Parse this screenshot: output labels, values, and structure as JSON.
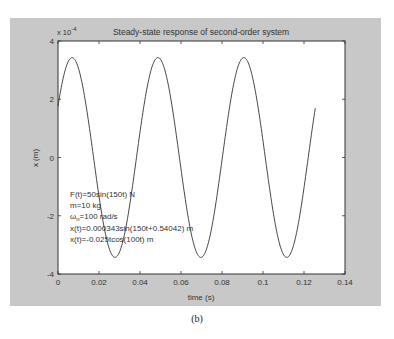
{
  "figure": {
    "background": "#c8c8c8",
    "caption": "(b)"
  },
  "chart_data": {
    "type": "line",
    "title": "Steady-state response of second-order system",
    "xlabel": "time (s)",
    "ylabel": "x (m)",
    "y_exponent_label": "x 10",
    "y_exponent": "-4",
    "xlim": [
      0,
      0.14
    ],
    "ylim": [
      -4,
      4
    ],
    "y_scale_factor": 0.0001,
    "xticks": [
      0,
      0.02,
      0.04,
      0.06,
      0.08,
      0.1,
      0.12,
      0.14
    ],
    "xtick_labels": [
      "0",
      "0.02",
      "0.04",
      "0.06",
      "0.08",
      "0.1",
      "0.12",
      "0.14"
    ],
    "yticks": [
      -4,
      -2,
      0,
      2,
      4
    ],
    "ytick_labels": [
      "-4",
      "-2",
      "0",
      "2",
      "4"
    ],
    "grid": false,
    "legend": null,
    "series": [
      {
        "name": "x(t)",
        "formula": "x(t)=0.000343sin(150t+0.54042)",
        "amplitude": 3.43,
        "omega": 150,
        "phase": 0.54042,
        "t_start": 0,
        "t_end": 0.1255,
        "color": "#333333",
        "sample_x": [
          0,
          0.005,
          0.01,
          0.015,
          0.02,
          0.025,
          0.03,
          0.035,
          0.04,
          0.045,
          0.05,
          0.055,
          0.06,
          0.065,
          0.07,
          0.075,
          0.08,
          0.085,
          0.09,
          0.095,
          0.1,
          0.105,
          0.11,
          0.115,
          0.12,
          0.125
        ],
        "sample_y": [
          1.77,
          3.38,
          2.93,
          0.73,
          -1.83,
          -3.39,
          -2.9,
          -0.68,
          1.87,
          3.41,
          2.87,
          0.62,
          -1.92,
          -3.42,
          -2.83,
          -0.57,
          1.96,
          3.42,
          2.8,
          0.51,
          -2.01,
          -3.43,
          -2.76,
          -0.45,
          2.05,
          3.43
        ]
      }
    ],
    "annotations": [
      {
        "text": "F(t)=50sin(150t)  N"
      },
      {
        "text": "m=10 kg"
      },
      {
        "text_main": "ω",
        "text_sub": "n",
        "text_rest": "=100 rad/s"
      },
      {
        "text": "x(t)=0.000343sin(150t+0.54042)    m"
      },
      {
        "text": "x(t)=-0.025tcos(100t)   m"
      }
    ]
  }
}
